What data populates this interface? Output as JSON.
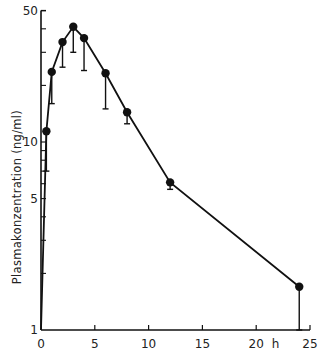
{
  "chart_data": {
    "type": "line",
    "title": "",
    "xlabel": "h",
    "ylabel": "Plasmakonzentration (ng/ml)",
    "x_ticks": [
      "0",
      "5",
      "10",
      "15",
      "20",
      "25"
    ],
    "y_ticks": [
      "1",
      "5",
      "10",
      "50"
    ],
    "y_scale": "log",
    "xlim": [
      0,
      25
    ],
    "ylim": [
      1,
      50
    ],
    "grid": false,
    "legend": null,
    "series": [
      {
        "name": "Plasmakonzentration",
        "marker": "filled-circle",
        "error_bars": "lower",
        "x": [
          0.5,
          1,
          2,
          3,
          4,
          6,
          8,
          12,
          24
        ],
        "y": [
          11.4,
          23.6,
          34,
          41,
          35.7,
          23.2,
          14.4,
          6.1,
          1.7
        ],
        "y_lower": [
          7,
          16,
          25,
          30,
          24,
          15,
          12.5,
          5.6,
          1
        ]
      }
    ]
  },
  "labels": {
    "ylabel": "Plasmakonzentration (ng/ml)",
    "x_unit": "h"
  }
}
